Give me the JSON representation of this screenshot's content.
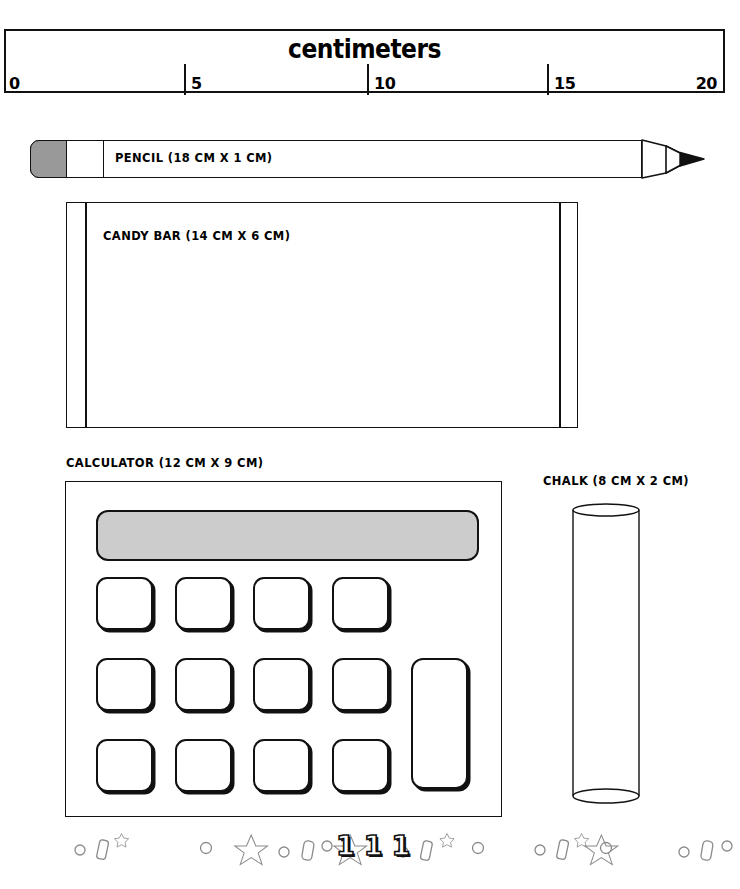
{
  "ruler": {
    "title": "centimeters",
    "unit": "cm",
    "ticks": [
      {
        "label": "0",
        "value": 0,
        "x": 4
      },
      {
        "label": "5",
        "value": 5,
        "x": 182
      },
      {
        "label": "10",
        "value": 10,
        "x": 365
      },
      {
        "label": "15",
        "value": 15,
        "x": 545
      },
      {
        "label": "20",
        "value": 20,
        "x": 723
      }
    ]
  },
  "objects": {
    "pencil": {
      "label": "PENCIL (18 CM X 1 CM)",
      "name": "PENCIL",
      "length_cm": 18,
      "width_cm": 1,
      "eraser_color": "#999999"
    },
    "candy_bar": {
      "label": "CANDY BAR (14 CM X 6 CM)",
      "name": "CANDY BAR",
      "length_cm": 14,
      "width_cm": 6
    },
    "calculator": {
      "label": "CALCULATOR (12 CM X 9 CM)",
      "name": "CALCULATOR",
      "length_cm": 12,
      "width_cm": 9,
      "display_color": "#cccccc",
      "key_count": 13
    },
    "chalk": {
      "label": "CHALK (8 CM X 2 CM)",
      "name": "CHALK",
      "length_cm": 8,
      "width_cm": 2
    }
  },
  "decoration": {
    "digits": "111",
    "motifs": [
      "circle",
      "rounded-rect",
      "star",
      "circle",
      "star",
      "circle",
      "rounded-rect",
      "circle",
      "star",
      "circle",
      "rounded-rect",
      "star",
      "circle"
    ]
  },
  "colors": {
    "ink": "#111111",
    "paper": "#ffffff",
    "gray_fill": "#999999",
    "display_gray": "#cccccc",
    "deco_line": "#8a8a8a"
  }
}
